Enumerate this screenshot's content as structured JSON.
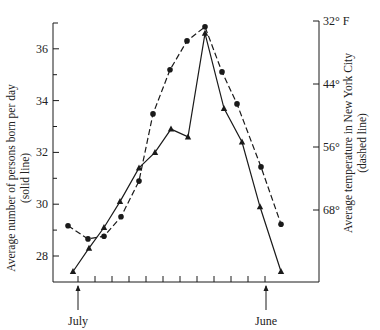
{
  "chart_data": {
    "type": "line",
    "title": "",
    "xlabel": "",
    "x_annotations": [
      {
        "label": "July",
        "index": 1.3
      },
      {
        "label": "June",
        "index": 12.2
      }
    ],
    "x": [
      1,
      2,
      3,
      4,
      5,
      6,
      7,
      8,
      9,
      10,
      11,
      12,
      13
    ],
    "left_axis": {
      "label_line1": "Average number of persons born per day",
      "label_line2": "(solid line)",
      "ticks": [
        28,
        30,
        32,
        34,
        36
      ],
      "tick_labels": [
        "28",
        "30",
        "32",
        "34",
        "36"
      ],
      "ylim": [
        27,
        37
      ]
    },
    "right_axis": {
      "label_line1": "Average temperature in New York City",
      "label_line2": "(dashed line)",
      "ticks": [
        32,
        44,
        56,
        68
      ],
      "tick_labels": [
        "32° F",
        "44°",
        "56°",
        "68°"
      ],
      "inverted": true
    },
    "series": [
      {
        "name": "Average number of persons born per day",
        "style": "solid",
        "marker": "triangle",
        "axis": "left",
        "values": [
          27.4,
          28.3,
          29.1,
          30.1,
          31.4,
          32.0,
          32.9,
          32.6,
          36.6,
          33.7,
          32.4,
          29.9,
          27.4
        ]
      },
      {
        "name": "Average temperature in New York City (°F)",
        "style": "dashed",
        "marker": "circle",
        "axis": "right",
        "values": [
          71.0,
          73.5,
          73.0,
          69.3,
          62.5,
          49.7,
          41.3,
          35.8,
          33.1,
          41.7,
          47.8,
          59.8,
          70.7
        ]
      }
    ],
    "grid": false,
    "legend": "none (series identified in axis titles)"
  },
  "labels": {
    "left_title_1": "Average number of persons born per day",
    "left_title_2": "(solid line)",
    "right_title_1": "Average temperature in New York City",
    "right_title_2": "(dashed line)",
    "month_start": "July",
    "month_end": "June",
    "left_ticks": [
      "28",
      "30",
      "32",
      "34",
      "36"
    ],
    "right_ticks": [
      "32° F",
      "44°",
      "56°",
      "68°"
    ]
  },
  "colors": {
    "ink": "#1a1a1a",
    "background": "#ffffff"
  }
}
